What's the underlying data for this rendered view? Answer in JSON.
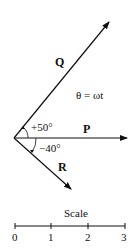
{
  "diagram": {
    "type": "phasor-diagram",
    "vectors": [
      {
        "name": "Q",
        "label": "Q",
        "angle_deg": 50
      },
      {
        "name": "P",
        "label": "P",
        "angle_deg": 0
      },
      {
        "name": "R",
        "label": "R",
        "angle_deg": -40
      }
    ],
    "angle_labels": {
      "q_angle": "+50°",
      "r_angle": "−40°"
    },
    "equation": "θ = ωt",
    "scale": {
      "title": "Scale",
      "ticks": [
        "0",
        "1",
        "2",
        "3"
      ]
    },
    "colors": {
      "stroke": "#111111",
      "background": "#ffffff"
    }
  }
}
